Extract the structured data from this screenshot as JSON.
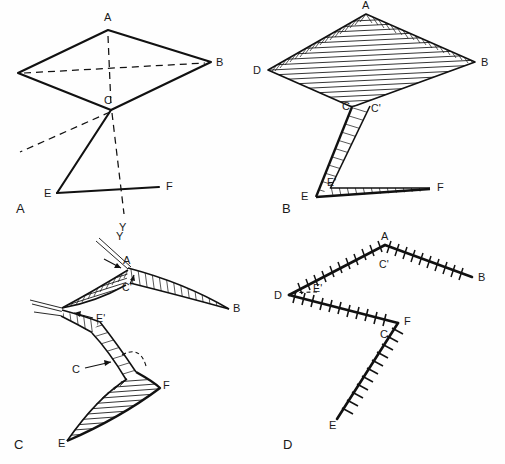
{
  "figure": {
    "kind": "four-panel structural geology fold diagram",
    "background_color": "#ffffff",
    "ink_color": "#111111",
    "width": 505,
    "height": 464
  },
  "panels": [
    {
      "id": "A",
      "panel_label": "A",
      "panel_label_pos": [
        16,
        212
      ],
      "description": "line drawing of undeformed rhombic surface with axial trace",
      "vertices": {
        "A": {
          "label": "A",
          "x": 108,
          "y": 30,
          "label_x": 104,
          "label_y": 21
        },
        "D": {
          "label": "",
          "x": 18,
          "y": 73,
          "label_x": 8,
          "label_y": 70
        },
        "B": {
          "label": "B",
          "x": 211,
          "y": 62,
          "label_x": 216,
          "label_y": 64
        },
        "C": {
          "label": "C",
          "x": 111,
          "y": 110,
          "label_x": 104,
          "label_y": 103
        },
        "E": {
          "label": "E",
          "x": 57,
          "y": 193,
          "label_x": 45,
          "label_y": 196
        },
        "F": {
          "label": "F",
          "x": 159,
          "y": 187,
          "label_x": 166,
          "label_y": 189
        },
        "Y": {
          "label": "Y",
          "x": 124,
          "y": 216,
          "label_x": 119,
          "label_y": 229
        }
      },
      "solid_edges": [
        [
          "A",
          "D"
        ],
        [
          "A",
          "B"
        ],
        [
          "D",
          "C"
        ],
        [
          "C",
          "B"
        ],
        [
          "C",
          "E"
        ],
        [
          "E",
          "F"
        ]
      ],
      "dashed_edges": [
        [
          "A",
          "C"
        ],
        [
          "D",
          "B"
        ],
        [
          "C",
          "Y"
        ]
      ],
      "dashed_ray": {
        "from": [
          111,
          110
        ],
        "to": [
          18,
          152
        ]
      }
    },
    {
      "id": "B",
      "panel_label": "B",
      "panel_label_pos": [
        285,
        210
      ],
      "description": "same surface rendered as hatched sheet with limbs C-C' and E-E'",
      "vertices": {
        "A": {
          "label": "A",
          "x": 366,
          "y": 14,
          "label_x": 362,
          "label_y": 7
        },
        "D": {
          "label": "D",
          "x": 268,
          "y": 70,
          "label_x": 254,
          "label_y": 71
        },
        "B": {
          "label": "B",
          "x": 475,
          "y": 62,
          "label_x": 481,
          "label_y": 65
        },
        "C": {
          "label": "C",
          "x": 352,
          "y": 107,
          "label_x": 344,
          "label_y": 110
        },
        "Cp": {
          "label": "C'",
          "x": 370,
          "y": 106,
          "label_x": 371,
          "label_y": 110
        },
        "E": {
          "label": "E",
          "x": 316,
          "y": 196,
          "label_x": 303,
          "label_y": 198
        },
        "Ep": {
          "label": "E'",
          "x": 330,
          "y": 188,
          "label_x": 329,
          "label_y": 184
        },
        "F": {
          "label": "F",
          "x": 430,
          "y": 188,
          "label_x": 437,
          "label_y": 188
        }
      }
    },
    {
      "id": "C",
      "panel_label": "C",
      "panel_label_pos": [
        16,
        446
      ],
      "description": "folded configuration, hatched limbs with arrow callouts",
      "vertices": {
        "Y": {
          "label": "Y",
          "x": 120,
          "y": 234,
          "label_x": 116,
          "label_y": 238
        },
        "A": {
          "label": "A",
          "x": 128,
          "y": 267,
          "label_x": 124,
          "label_y": 261
        },
        "Cp": {
          "label": "C'",
          "x": 130,
          "y": 281,
          "label_x": 124,
          "label_y": 287
        },
        "B": {
          "label": "B",
          "x": 229,
          "y": 308,
          "label_x": 233,
          "label_y": 309
        },
        "Ep": {
          "label": "E'",
          "x": 100,
          "y": 321,
          "label_x": 97,
          "label_y": 317
        },
        "C": {
          "label": "C",
          "x": 82,
          "y": 370,
          "label_x": 74,
          "label_y": 371
        },
        "F": {
          "label": "F",
          "x": 159,
          "y": 387,
          "label_x": 163,
          "label_y": 386
        },
        "E": {
          "label": "E",
          "x": 67,
          "y": 440,
          "label_x": 60,
          "label_y": 443
        }
      },
      "callouts": [
        {
          "name": "label-E-prime-arrow",
          "from": [
            92,
            318
          ],
          "to": [
            72,
            312
          ]
        },
        {
          "name": "label-C-arrow",
          "from": [
            84,
            368
          ],
          "to": [
            110,
            362
          ]
        },
        {
          "name": "label-A-arrow",
          "from": [
            104,
            260
          ],
          "to": [
            118,
            268
          ]
        },
        {
          "name": "label-Cprime-arrow",
          "from": [
            128,
            286
          ],
          "to": [
            132,
            276
          ]
        }
      ]
    },
    {
      "id": "D",
      "panel_label": "D",
      "panel_label_pos": [
        285,
        445
      ],
      "description": "map view of fold traces with tick (hachure) ornament",
      "vertices": {
        "A": {
          "label": "A",
          "x": 385,
          "y": 245,
          "label_x": 381,
          "label_y": 238
        },
        "Cp": {
          "label": "C'",
          "x": 382,
          "y": 262,
          "label_x": 380,
          "label_y": 265
        },
        "B": {
          "label": "B",
          "x": 472,
          "y": 277,
          "label_x": 478,
          "label_y": 280
        },
        "D": {
          "label": "D",
          "x": 289,
          "y": 295,
          "label_x": 276,
          "label_y": 296
        },
        "Ep": {
          "label": "E'",
          "x": 318,
          "y": 292,
          "label_x": 315,
          "label_y": 290
        },
        "F": {
          "label": "F",
          "x": 398,
          "y": 323,
          "label_x": 404,
          "label_y": 322
        },
        "C": {
          "label": "C",
          "x": 390,
          "y": 333,
          "label_x": 382,
          "label_y": 336
        },
        "E": {
          "label": "E",
          "x": 337,
          "y": 419,
          "label_x": 330,
          "label_y": 426
        }
      },
      "tick_paths": [
        {
          "name": "trace-A-D",
          "points": [
            [
              385,
              245
            ],
            [
              289,
              295
            ]
          ]
        },
        {
          "name": "trace-A-B",
          "points": [
            [
              385,
              245
            ],
            [
              472,
              277
            ]
          ]
        },
        {
          "name": "trace-D-F",
          "points": [
            [
              289,
              295
            ],
            [
              398,
              323
            ]
          ]
        },
        {
          "name": "trace-F-E",
          "points": [
            [
              398,
              323
            ],
            [
              337,
              419
            ]
          ]
        }
      ]
    }
  ]
}
